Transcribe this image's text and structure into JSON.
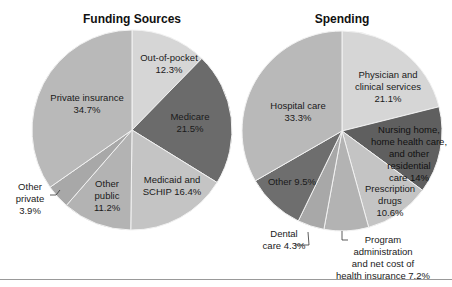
{
  "chart_data": [
    {
      "type": "pie",
      "title": "Funding Sources",
      "slices": [
        {
          "label": "Out-of-pocket",
          "value": 12.3,
          "color": "#d6d6d6"
        },
        {
          "label": "Medicare",
          "value": 21.5,
          "color": "#6b6b6b"
        },
        {
          "label": "Medicaid and SCHIP",
          "value": 16.4,
          "color": "#c4c4c4"
        },
        {
          "label": "Other public",
          "value": 11.2,
          "color": "#b3b3b3"
        },
        {
          "label": "Other private",
          "value": 3.9,
          "color": "#a8a8a8"
        },
        {
          "label": "Private insurance",
          "value": 34.7,
          "color": "#b9b9b9"
        }
      ]
    },
    {
      "type": "pie",
      "title": "Spending",
      "slices": [
        {
          "label": "Physician and clinical services",
          "value": 21.1,
          "color": "#d6d6d6"
        },
        {
          "label": "Nursing home, home health care, and other residential care",
          "value": 14.0,
          "color": "#5f5f5f"
        },
        {
          "label": "Prescription drugs",
          "value": 10.6,
          "color": "#c4c4c4"
        },
        {
          "label": "Program administration and net cost of health insurance",
          "value": 7.2,
          "color": "#b3b3b3"
        },
        {
          "label": "Dental care",
          "value": 4.3,
          "color": "#a8a8a8"
        },
        {
          "label": "Other",
          "value": 9.5,
          "color": "#6e6e6e"
        },
        {
          "label": "Hospital care",
          "value": 33.3,
          "color": "#b9b9b9"
        }
      ]
    }
  ],
  "titles": {
    "left": "Funding Sources",
    "right": "Spending"
  },
  "labels": {
    "oop": [
      "Out-of-pocket",
      "12.3%"
    ],
    "medicare": [
      "Medicare",
      "21.5%"
    ],
    "medicaid": [
      "Medicaid and",
      "SCHIP 16.4%"
    ],
    "otherpublic": [
      "Other",
      "public",
      "11.2%"
    ],
    "otherprivate": [
      "Other",
      "private",
      "3.9%"
    ],
    "private": [
      "Private insurance",
      "34.7%"
    ],
    "physician": [
      "Physician and",
      "clinical services",
      "21.1%"
    ],
    "nursing": [
      "Nursing home,",
      "home health care,",
      "and other",
      "residential",
      "care 14%"
    ],
    "rx": [
      "Prescription",
      "drugs",
      "10.6%"
    ],
    "program": [
      "Program",
      "administration",
      "and net cost of",
      "health insurance 7.2%"
    ],
    "dental": [
      "Dental",
      "care 4.3%"
    ],
    "other": [
      "Other 9.5%"
    ],
    "hospital": [
      "Hospital care",
      "33.3%"
    ]
  }
}
